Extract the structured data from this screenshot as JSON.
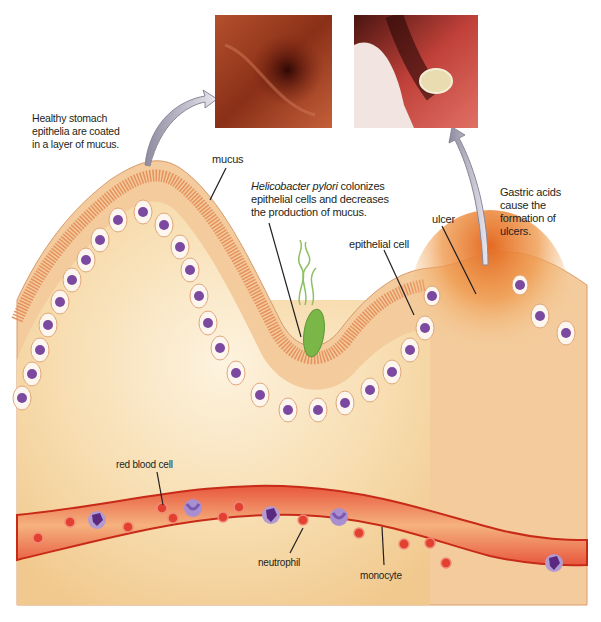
{
  "figure": {
    "photos": [
      {
        "name": "healthy-stomach-endoscopy",
        "description": "Endoscopic view of healthy stomach lining"
      },
      {
        "name": "ulcer-endoscopy",
        "description": "Endoscopic view of stomach ulcer"
      }
    ],
    "labels": {
      "healthy_line1": "Healthy stomach",
      "healthy_line2": "epithelia are coated",
      "healthy_line3": "in a layer of mucus.",
      "mucus": "mucus",
      "hpylori_italic": "Helicobacter pylori",
      "hpylori_line1_rest": " colonizes",
      "hpylori_line2": "epithelial cells and decreases",
      "hpylori_line3": "the production of mucus.",
      "epithelial_cell": "epithelial cell",
      "ulcer": "ulcer",
      "gastric_line1": "Gastric acids",
      "gastric_line2": "cause the",
      "gastric_line3": "formation of",
      "gastric_line4": "ulcers.",
      "red_blood_cell": "red blood cell",
      "neutrophil": "neutrophil",
      "monocyte": "monocyte"
    },
    "colors": {
      "tissue": "#f6d9a8",
      "tissue_light": "#fdf1dc",
      "mucus_layer": "#f2c89a",
      "microvilli": "#e89a6a",
      "nucleus": "#7b4aa0",
      "cell_fill": "#fdf6ee",
      "ulcer": "#e8782e",
      "vessel_wall": "#d9321f",
      "vessel_inner": "#f4b07a",
      "rbc": "#e2412f",
      "bacterium": "#7ab648",
      "arrow": "#b9b6c6"
    }
  }
}
